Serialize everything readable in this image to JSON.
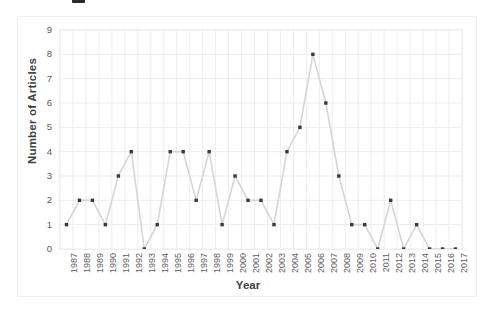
{
  "chart_data": {
    "type": "line",
    "title": "",
    "xlabel": "Year",
    "ylabel": "Number of Articles",
    "categories": [
      "1987",
      "1988",
      "1989",
      "1990",
      "1991",
      "1992",
      "1993",
      "1994",
      "1995",
      "1996",
      "1997",
      "1998",
      "1999",
      "2000",
      "2001",
      "2002",
      "2003",
      "2004",
      "2005",
      "2006",
      "2007",
      "2008",
      "2009",
      "2010",
      "2011",
      "2012",
      "2013",
      "2014",
      "2015",
      "2016",
      "2017"
    ],
    "values": [
      1,
      2,
      2,
      1,
      3,
      4,
      0,
      1,
      4,
      4,
      2,
      4,
      1,
      3,
      2,
      2,
      1,
      4,
      5,
      8,
      6,
      3,
      1,
      1,
      0,
      2,
      0,
      1,
      0,
      0,
      0
    ],
    "ylim": [
      0,
      9
    ],
    "yticks": [
      0,
      1,
      2,
      3,
      4,
      5,
      6,
      7,
      8,
      9
    ],
    "ytick_labels": [
      "0",
      "1",
      "2",
      "3",
      "4",
      "5",
      "6",
      "7",
      "8",
      "9"
    ],
    "grid": true,
    "grid_x": true,
    "grid_y": true,
    "legend": false,
    "marker": "square",
    "line_color": "#d6d6d6",
    "marker_color": "#3a3a3a",
    "grid_color": "#ededed",
    "series": [
      {
        "name": "Number of Articles",
        "values": [
          1,
          2,
          2,
          1,
          3,
          4,
          0,
          1,
          4,
          4,
          2,
          4,
          1,
          3,
          2,
          2,
          1,
          4,
          5,
          8,
          6,
          3,
          1,
          1,
          0,
          2,
          0,
          1,
          0,
          0,
          0
        ]
      }
    ]
  }
}
